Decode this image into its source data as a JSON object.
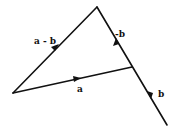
{
  "diagram": {
    "type": "vector-triangle",
    "points": {
      "origin": [
        13,
        93
      ],
      "apex": [
        97,
        7
      ],
      "junction": [
        132,
        67
      ],
      "end": [
        167,
        125
      ]
    },
    "vectors": [
      {
        "id": "a_minus_b",
        "label": "a - b",
        "from": "origin",
        "to": "apex",
        "label_pos": [
          34,
          44
        ]
      },
      {
        "id": "a",
        "label": "a",
        "from": "origin",
        "to": "junction",
        "label_pos": [
          77,
          92
        ]
      },
      {
        "id": "neg_b",
        "label": "-b",
        "from": "junction",
        "to": "apex",
        "label_pos": [
          118,
          37
        ]
      },
      {
        "id": "b",
        "label": "b",
        "from": "junction",
        "to": "end",
        "label_pos": [
          158,
          97
        ]
      }
    ],
    "line_color": "#111111",
    "background": "#ffffff"
  }
}
